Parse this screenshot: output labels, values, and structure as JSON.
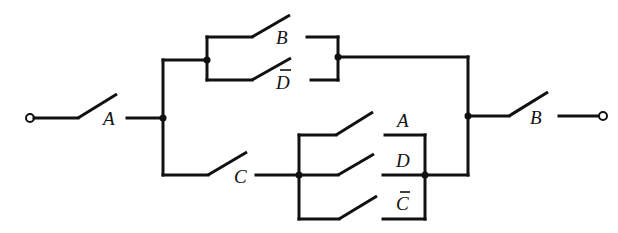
{
  "diagram": {
    "type": "switching-circuit",
    "colors": {
      "ink": "#111111",
      "background": "#ffffff"
    },
    "switches": [
      {
        "id": "sw-A-input",
        "label": "A",
        "complemented": false
      },
      {
        "id": "sw-B-upper",
        "label": "B",
        "complemented": false
      },
      {
        "id": "sw-Dbar-upper",
        "label": "D",
        "complemented": true
      },
      {
        "id": "sw-C",
        "label": "C",
        "complemented": false
      },
      {
        "id": "sw-A-lower",
        "label": "A",
        "complemented": false
      },
      {
        "id": "sw-D-lower",
        "label": "D",
        "complemented": false
      },
      {
        "id": "sw-Cbar-lower",
        "label": "C",
        "complemented": true
      },
      {
        "id": "sw-B-output",
        "label": "B",
        "complemented": false
      }
    ],
    "structure": "A · [ (B + D̄) + C · (A + D + C̄) ] · B",
    "terminals": [
      "input",
      "output"
    ]
  }
}
